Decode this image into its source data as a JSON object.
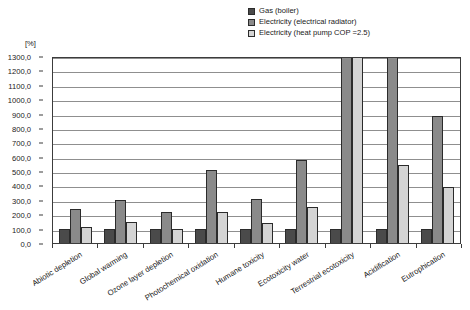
{
  "chart_data": {
    "type": "bar",
    "title": "",
    "xlabel": "",
    "ylabel": "[%]",
    "ylim": [
      0,
      1300
    ],
    "ytick_step": 100,
    "grid": true,
    "legend_position": "top-right",
    "categories": [
      "Abiotic depletion",
      "Global warming",
      "Ozone layer depletion",
      "Photochemical oxidation",
      "Humane toxicity",
      "Ecotoxicity water",
      "Terrestrial ecotoxicity",
      "Acidification",
      "Eutrophication"
    ],
    "ytick_labels": [
      "1300,0",
      "1200,0",
      "1100,0",
      "1000,0",
      "900,0",
      "800,0",
      "700,0",
      "600,0",
      "500,0",
      "400,0",
      "300,0",
      "200,0",
      "100,0",
      "0,0"
    ],
    "ytick_values": [
      1300,
      1200,
      1100,
      1000,
      900,
      800,
      700,
      600,
      500,
      400,
      300,
      200,
      100,
      0
    ],
    "series": [
      {
        "name": "Gas (boiler)",
        "color": "#4a4a4a",
        "values": [
          100,
          100,
          100,
          100,
          100,
          100,
          100,
          100,
          100
        ]
      },
      {
        "name": "Electricity (electrical radiator)",
        "color": "#8a8a8a",
        "values": [
          235,
          300,
          215,
          510,
          305,
          580,
          1400,
          1310,
          880
        ]
      },
      {
        "name": "Electricity (heat pump COP =2.5)",
        "color": "#d4d4d4",
        "values": [
          110,
          145,
          95,
          215,
          140,
          250,
          1400,
          540,
          390
        ]
      }
    ]
  },
  "colors": {
    "axis": "#3c3c3c",
    "gridline": "#8f8f8f",
    "bar_outline": "#2b2b2b",
    "background": "#ffffff"
  }
}
